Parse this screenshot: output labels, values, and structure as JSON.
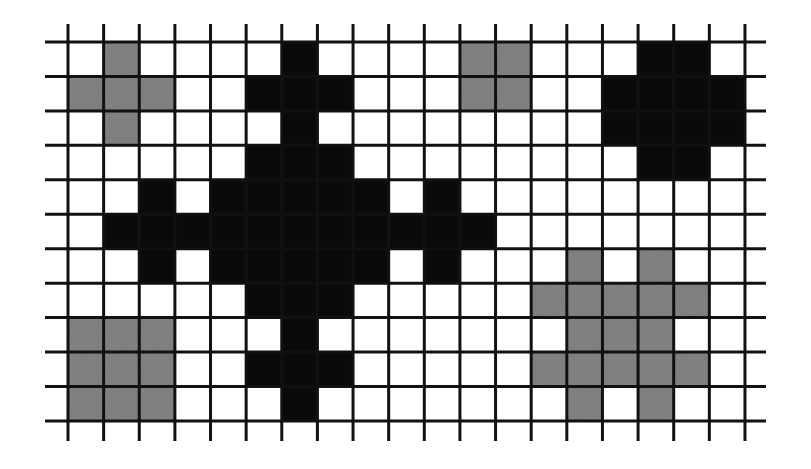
{
  "figure": {
    "title": "",
    "grid": {
      "cols": 19,
      "rows": 11,
      "origin_x": 68,
      "origin_y": 42,
      "cell_w": 35.63,
      "cell_h": 34.45,
      "line_color": "#111111",
      "line_width": 3,
      "h_line_extent": [
        45,
        766
      ],
      "v_line_extent": [
        24,
        441
      ],
      "background": "#ffffff"
    },
    "colors": {
      "black": "#0a0a0a",
      "gray": "#858585"
    },
    "shapes": [
      {
        "name": "small-gray-plus-top-left",
        "color": "gray",
        "cells": [
          [
            0,
            1
          ],
          [
            1,
            0
          ],
          [
            1,
            1
          ],
          [
            1,
            2
          ],
          [
            2,
            1
          ]
        ]
      },
      {
        "name": "gray-square-2x2-top",
        "color": "gray",
        "cells": [
          [
            0,
            11
          ],
          [
            0,
            12
          ],
          [
            1,
            11
          ],
          [
            1,
            12
          ]
        ]
      },
      {
        "name": "gray-square-3x3-bottom-left",
        "color": "gray",
        "cells": [
          [
            8,
            0
          ],
          [
            8,
            1
          ],
          [
            8,
            2
          ],
          [
            9,
            0
          ],
          [
            9,
            1
          ],
          [
            9,
            2
          ],
          [
            10,
            0
          ],
          [
            10,
            1
          ],
          [
            10,
            2
          ]
        ]
      },
      {
        "name": "gray-lattice-bottom-right",
        "color": "gray",
        "cells": [
          [
            6,
            14
          ],
          [
            6,
            16
          ],
          [
            7,
            13
          ],
          [
            7,
            14
          ],
          [
            7,
            15
          ],
          [
            7,
            16
          ],
          [
            7,
            17
          ],
          [
            8,
            14
          ],
          [
            8,
            15
          ],
          [
            8,
            16
          ],
          [
            9,
            13
          ],
          [
            9,
            14
          ],
          [
            9,
            15
          ],
          [
            9,
            16
          ],
          [
            9,
            17
          ],
          [
            10,
            14
          ],
          [
            10,
            16
          ]
        ]
      },
      {
        "name": "large-black-cross-center",
        "color": "black",
        "cells": [
          [
            0,
            6
          ],
          [
            1,
            5
          ],
          [
            1,
            6
          ],
          [
            1,
            7
          ],
          [
            2,
            6
          ],
          [
            3,
            5
          ],
          [
            3,
            6
          ],
          [
            3,
            7
          ],
          [
            4,
            2
          ],
          [
            4,
            4
          ],
          [
            4,
            5
          ],
          [
            4,
            6
          ],
          [
            4,
            7
          ],
          [
            4,
            8
          ],
          [
            4,
            10
          ],
          [
            5,
            1
          ],
          [
            5,
            2
          ],
          [
            5,
            3
          ],
          [
            5,
            4
          ],
          [
            5,
            5
          ],
          [
            5,
            6
          ],
          [
            5,
            7
          ],
          [
            5,
            8
          ],
          [
            5,
            9
          ],
          [
            5,
            10
          ],
          [
            5,
            11
          ],
          [
            6,
            2
          ],
          [
            6,
            4
          ],
          [
            6,
            5
          ],
          [
            6,
            6
          ],
          [
            6,
            7
          ],
          [
            6,
            8
          ],
          [
            6,
            10
          ],
          [
            7,
            5
          ],
          [
            7,
            6
          ],
          [
            7,
            7
          ],
          [
            8,
            6
          ],
          [
            9,
            5
          ],
          [
            9,
            6
          ],
          [
            9,
            7
          ],
          [
            10,
            6
          ]
        ]
      },
      {
        "name": "black-octagon-top-right",
        "color": "black",
        "cells": [
          [
            0,
            16
          ],
          [
            0,
            17
          ],
          [
            1,
            15
          ],
          [
            1,
            16
          ],
          [
            1,
            17
          ],
          [
            1,
            18
          ],
          [
            2,
            15
          ],
          [
            2,
            16
          ],
          [
            2,
            17
          ],
          [
            2,
            18
          ],
          [
            3,
            16
          ],
          [
            3,
            17
          ]
        ]
      }
    ]
  }
}
